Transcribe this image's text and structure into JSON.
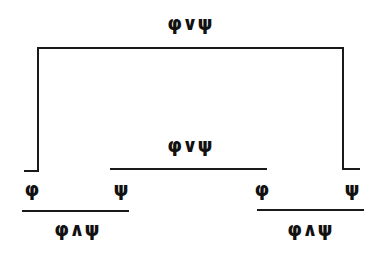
{
  "diagram": {
    "type": "proof-tree",
    "top_label": "φ∨ψ",
    "middle_label": "φ∨ψ",
    "leaves": [
      {
        "id": "leaf-1",
        "label": "φ"
      },
      {
        "id": "leaf-2",
        "label": "ψ"
      },
      {
        "id": "leaf-3",
        "label": "φ"
      },
      {
        "id": "leaf-4",
        "label": "ψ"
      }
    ],
    "left_conclusion": "φ∧ψ",
    "right_conclusion": "φ∧ψ"
  }
}
